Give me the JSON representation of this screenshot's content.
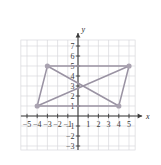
{
  "figure": {
    "title": "",
    "axis_labels": {
      "x": "x",
      "y": "y"
    },
    "x_tick_labels": [
      "−5",
      "−4",
      "−3",
      "−2",
      "−1",
      "1",
      "2",
      "3",
      "4",
      "5"
    ],
    "y_tick_labels": [
      "7",
      "6",
      "5",
      "4",
      "3",
      "2",
      "1",
      "−1",
      "−2",
      "−3"
    ],
    "colors": {
      "background": "#ffffff",
      "grid": "#d8d8dc",
      "axis": "#3b3b3b",
      "shape_stroke": "#9a93a3",
      "vertex_fill": "#a9a2b0",
      "tick_text": "#3b3b3b"
    }
  },
  "chart_data": {
    "type": "scatter",
    "title": "",
    "xlabel": "x",
    "ylabel": "y",
    "xlim": [
      -5.6,
      5.6
    ],
    "ylim": [
      -3.4,
      7.6
    ],
    "xticks": [
      -5,
      -4,
      -3,
      -2,
      -1,
      1,
      2,
      3,
      4,
      5
    ],
    "yticks": [
      7,
      6,
      5,
      4,
      3,
      2,
      1,
      -1,
      -2,
      -3
    ],
    "grid": true,
    "legend": "none",
    "shapes": [
      {
        "name": "parallelogram",
        "closed": true,
        "fill": "none",
        "vertices": [
          {
            "x": -3,
            "y": 5
          },
          {
            "x": 5,
            "y": 5
          },
          {
            "x": 4,
            "y": 1
          },
          {
            "x": -4,
            "y": 1
          }
        ]
      },
      {
        "name": "diagonal-1",
        "closed": false,
        "fill": "none",
        "vertices": [
          {
            "x": -3,
            "y": 5
          },
          {
            "x": 4,
            "y": 1
          }
        ]
      },
      {
        "name": "diagonal-2",
        "closed": false,
        "fill": "none",
        "vertices": [
          {
            "x": -4,
            "y": 1
          },
          {
            "x": 5,
            "y": 5
          }
        ]
      }
    ],
    "points": [
      {
        "x": -3,
        "y": 5,
        "label": ""
      },
      {
        "x": 5,
        "y": 5,
        "label": ""
      },
      {
        "x": 4,
        "y": 1,
        "label": ""
      },
      {
        "x": -4,
        "y": 1,
        "label": ""
      }
    ]
  }
}
